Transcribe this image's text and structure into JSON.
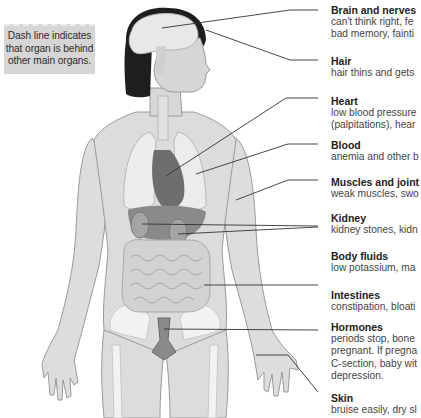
{
  "callout": {
    "lines": [
      "Dash line indicates",
      "that organ is behind",
      "other main organs."
    ]
  },
  "labels": [
    {
      "title": "Brain and nerves",
      "desc": [
        "can't think right, fe",
        "bad memory, fainti"
      ],
      "top": 4
    },
    {
      "title": "Hair",
      "desc": [
        "hair thins and gets"
      ],
      "top": 55
    },
    {
      "title": "Heart",
      "desc": [
        "low blood pressure",
        "(palpitations), hear"
      ],
      "top": 95
    },
    {
      "title": "Blood",
      "desc": [
        "anemia and other b"
      ],
      "top": 139
    },
    {
      "title": "Muscles and joint",
      "desc": [
        "weak muscles, swo"
      ],
      "top": 176
    },
    {
      "title": "Kidney",
      "desc": [
        "kidney stones, kidn"
      ],
      "top": 212
    },
    {
      "title": "Body fluids",
      "desc": [
        "low potassium, ma"
      ],
      "top": 250
    },
    {
      "title": "Intestines",
      "desc": [
        "constipation, bloati"
      ],
      "top": 289
    },
    {
      "title": "Hormones",
      "desc": [
        "periods stop, bone",
        "pregnant. If pregna",
        "C-section, baby wit",
        "depression."
      ],
      "top": 321
    },
    {
      "title": "Skin",
      "desc": [
        "bruise easily, dry sl"
      ],
      "top": 392
    }
  ],
  "colors": {
    "skin": "#dcdcdc",
    "skin_outline": "#9a9a9a",
    "hair": "#1e1e1e",
    "brain": "#e8e8e8",
    "lungs": "#ececec",
    "heart": "#6e6e6e",
    "liver": "#8a8a8a",
    "intestine": "#d2d2d2",
    "bone": "#f4f4f4",
    "leader_line": "#333333",
    "callout_bg": "#d6d6d6"
  }
}
